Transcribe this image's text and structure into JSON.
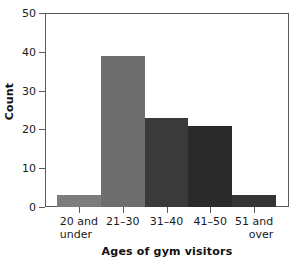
{
  "chart_data": {
    "type": "bar",
    "title": "",
    "xlabel": "Ages of gym visitors",
    "ylabel": "Count",
    "categories": [
      "20 and under",
      "21–30",
      "31–40",
      "41–50",
      "51 and over"
    ],
    "category_lines": [
      {
        "line1": "20 and",
        "line2": "under",
        "align": "align-left"
      },
      {
        "line1": "21–30",
        "line2": "",
        "align": "center"
      },
      {
        "line1": "31–40",
        "line2": "",
        "align": "center"
      },
      {
        "line1": "41–50",
        "line2": "",
        "align": "center"
      },
      {
        "line1": "51 and",
        "line2": "over",
        "align": "align-right"
      }
    ],
    "values": [
      3,
      39,
      23,
      21,
      3
    ],
    "bar_colors": [
      "#7d7d7d",
      "#6e6e6e",
      "#3a3a3a",
      "#2a2a2a",
      "#353535"
    ],
    "ylim": [
      0,
      50
    ],
    "yticks": [
      0,
      10,
      20,
      30,
      40,
      50
    ],
    "ytick_labels": [
      "0",
      "10",
      "20",
      "30",
      "40",
      "50"
    ],
    "grid": false,
    "legend": "none",
    "frame_color": "#595959",
    "background": "#ffffff"
  }
}
